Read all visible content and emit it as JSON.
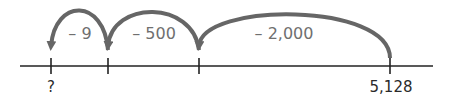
{
  "number_line": {
    "axis": {
      "x_start": 20,
      "x_end": 433,
      "y": 66,
      "color": "#222222"
    },
    "arc_color": "#666666",
    "ticks": [
      {
        "x": 51,
        "label": "?"
      },
      {
        "x": 108,
        "label": ""
      },
      {
        "x": 199,
        "label": ""
      },
      {
        "x": 390,
        "label": "5,128"
      }
    ],
    "jumps": [
      {
        "from_x": 390,
        "to_x": 199,
        "label": "– 2,000",
        "label_x": 284,
        "top_y": 12
      },
      {
        "from_x": 199,
        "to_x": 108,
        "label": "– 500",
        "label_x": 154,
        "top_y": 10
      },
      {
        "from_x": 108,
        "to_x": 51,
        "label": "– 9",
        "label_x": 80,
        "top_y": 10
      }
    ]
  }
}
